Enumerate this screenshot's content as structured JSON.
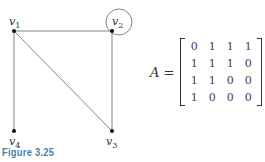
{
  "figure": {
    "caption": "Figure 3.25",
    "caption_color": "#4a7fa8"
  },
  "graph": {
    "vertices": [
      {
        "id": "v1",
        "label": "v",
        "sub": "1",
        "x": 14,
        "y": 31
      },
      {
        "id": "v2",
        "label": "v",
        "sub": "2",
        "x": 112,
        "y": 31
      },
      {
        "id": "v3",
        "label": "v",
        "sub": "3",
        "x": 112,
        "y": 131
      },
      {
        "id": "v4",
        "label": "v",
        "sub": "4",
        "x": 14,
        "y": 131
      }
    ],
    "edges": [
      [
        "v1",
        "v2"
      ],
      [
        "v1",
        "v3"
      ],
      [
        "v1",
        "v4"
      ],
      [
        "v2",
        "v3"
      ],
      [
        "v2",
        "v2"
      ]
    ]
  },
  "matrix": {
    "name": "A",
    "equals": "=",
    "rows": [
      [
        "0",
        "1",
        "1",
        "1"
      ],
      [
        "1",
        "1",
        "1",
        "0"
      ],
      [
        "1",
        "1",
        "0",
        "0"
      ],
      [
        "1",
        "0",
        "0",
        "0"
      ]
    ]
  }
}
